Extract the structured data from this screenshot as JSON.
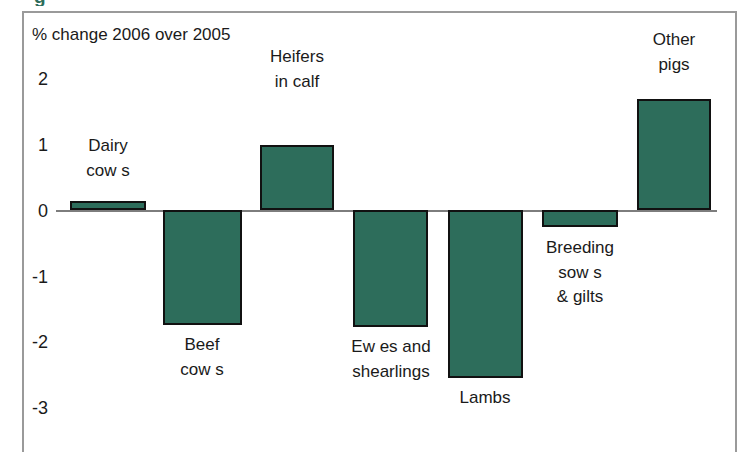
{
  "clipped_heading_text": "g",
  "chart_data": {
    "type": "bar",
    "title": "",
    "axis_note": "% change 2006 over 2005",
    "xlabel": "",
    "ylabel": "",
    "ylim": [
      -3.4,
      2.4
    ],
    "yticks": [
      "2",
      "1",
      "0",
      "-1",
      "-2",
      "-3"
    ],
    "ytick_values": [
      2,
      1,
      0,
      -1,
      -2,
      -3
    ],
    "grid": false,
    "legend": "none",
    "bar_color": "#2d6d5b",
    "bar_border_color": "#111111",
    "axis_line_color": "#7d7d7d",
    "frame_color": "#9a9a9a",
    "categories": [
      "Dairy\ncow s",
      "Beef\ncow s",
      "Heifers\nin calf",
      "Ew es and\nshearlings",
      "Lambs",
      "Breeding\nsow s\n& gilts",
      "Other\npigs"
    ],
    "values": [
      0.13,
      -1.76,
      1.0,
      -1.79,
      -2.56,
      -0.26,
      1.69
    ],
    "bars": [
      {
        "label": "Dairy\ncow s",
        "value": 0.13,
        "label_pos": "above"
      },
      {
        "label": "Beef\ncow s",
        "value": -1.76,
        "label_pos": "below"
      },
      {
        "label": "Heifers\nin calf",
        "value": 1.0,
        "label_pos": "above"
      },
      {
        "label": "Ew es and\nshearlings",
        "value": -1.79,
        "label_pos": "below"
      },
      {
        "label": "Lambs",
        "value": -2.56,
        "label_pos": "below"
      },
      {
        "label": "Breeding\nsow s\n& gilts",
        "value": -0.26,
        "label_pos": "below"
      },
      {
        "label": "Other\npigs",
        "value": 1.69,
        "label_pos": "above"
      }
    ]
  },
  "yticks": [
    {
      "label": "2"
    },
    {
      "label": "1"
    },
    {
      "label": "0"
    },
    {
      "label": "-1"
    },
    {
      "label": "-2"
    },
    {
      "label": "-3"
    }
  ],
  "bar_labels": [
    {
      "text": "Dairy\ncow s"
    },
    {
      "text": "Beef\ncow s"
    },
    {
      "text": "Heifers\nin calf"
    },
    {
      "text": "Ew es and\nshearlings"
    },
    {
      "text": "Lambs"
    },
    {
      "text": "Breeding\nsow s\n& gilts"
    },
    {
      "text": "Other\npigs"
    }
  ]
}
